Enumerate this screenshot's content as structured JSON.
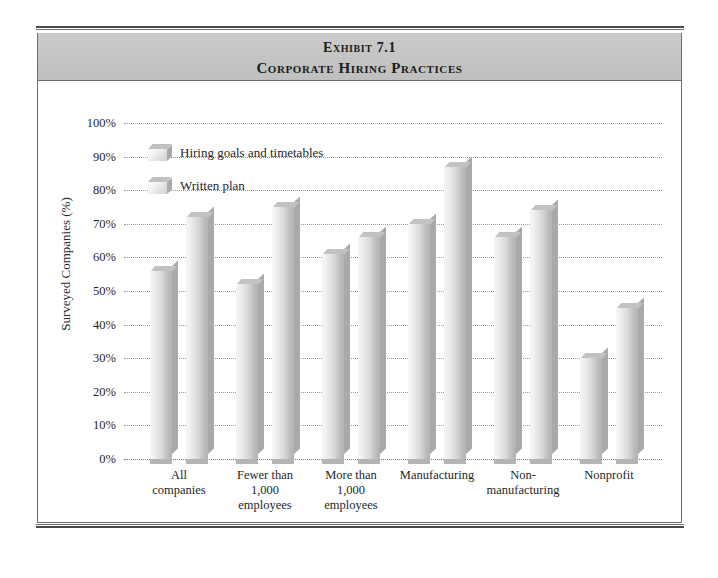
{
  "exhibit": {
    "title_line_1": "Exhibit 7.1",
    "title_line_2": "Corporate Hiring Practices"
  },
  "chart_data": {
    "type": "bar",
    "title": "Corporate Hiring Practices",
    "subtitle": "Exhibit 7.1",
    "xlabel": "",
    "ylabel": "Surveyed Companies (%)",
    "ylim": [
      0,
      100
    ],
    "grid": true,
    "legend_position": "top-left inside plot",
    "categories": [
      "All companies",
      "Fewer than 1,000 employees",
      "More than 1,000 employees",
      "Manufacturing",
      "Non-manufacturing",
      "Nonprofit"
    ],
    "category_label_lines": [
      [
        "All",
        "companies"
      ],
      [
        "Fewer  than",
        "1,000",
        "employees"
      ],
      [
        "More than",
        "1,000",
        "employees"
      ],
      [
        "Manufacturing"
      ],
      [
        "Non-",
        "manufacturing"
      ],
      [
        "Nonprofit"
      ]
    ],
    "series": [
      {
        "name": "Hiring goals and timetables",
        "values": [
          56,
          52,
          61,
          70,
          66,
          30
        ]
      },
      {
        "name": "Written plan",
        "values": [
          72,
          75,
          66,
          87,
          74,
          45
        ]
      }
    ],
    "ytick_labels": [
      "0%",
      "10%",
      "20%",
      "30%",
      "40%",
      "50%",
      "60%",
      "70%",
      "80%",
      "90%",
      "100%"
    ],
    "ytick_values": [
      0,
      10,
      20,
      30,
      40,
      50,
      60,
      70,
      80,
      90,
      100
    ]
  },
  "colors": {
    "title_band": "#c4c4c4",
    "frame_border": "#6f6f6f",
    "rule": "#4a4a4a",
    "bar_front_light": "#f6f6f6",
    "bar_front_dark": "#b2b2b2",
    "bar_side": "#a9a9a9",
    "bar_top": "#c2c2c2",
    "gridline": "#9a9a9a",
    "text": "#1f1f1f"
  }
}
